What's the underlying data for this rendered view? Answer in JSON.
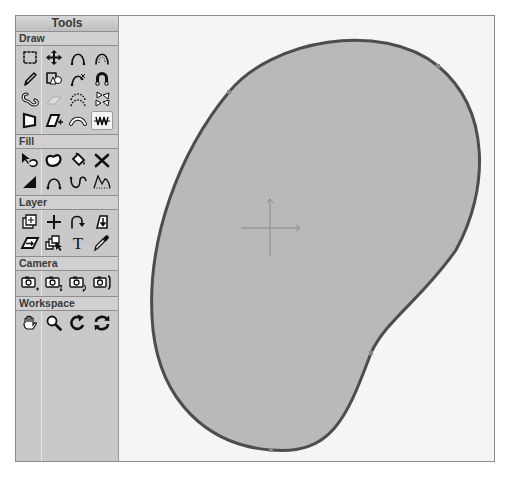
{
  "tools_panel": {
    "title": "Tools",
    "sections": [
      {
        "label": "Draw",
        "tools": [
          {
            "name": "marquee-select",
            "icon": "dashed-square-icon"
          },
          {
            "name": "move",
            "icon": "four-way-arrow-icon"
          },
          {
            "name": "arc",
            "icon": "arc-icon"
          },
          {
            "name": "dotted-arc",
            "icon": "dotted-arch-icon"
          },
          {
            "name": "pencil",
            "icon": "pencil-icon"
          },
          {
            "name": "shapes",
            "icon": "shapes-icon"
          },
          {
            "name": "curve-edit",
            "icon": "curve-points-icon"
          },
          {
            "name": "magnet",
            "icon": "magnet-icon"
          },
          {
            "name": "freeform-blob",
            "icon": "squiggle-icon"
          },
          {
            "name": "eraser",
            "icon": "eraser-icon"
          },
          {
            "name": "point-arc",
            "icon": "point-arc-icon"
          },
          {
            "name": "triangles",
            "icon": "triangles-icon"
          },
          {
            "name": "polygon",
            "icon": "polygon-icon"
          },
          {
            "name": "parallelogram-add",
            "icon": "parallelogram-icon"
          },
          {
            "name": "bend",
            "icon": "bend-icon"
          },
          {
            "name": "wave",
            "icon": "wave-icon",
            "selected": true
          }
        ]
      },
      {
        "label": "Fill",
        "tools": [
          {
            "name": "fill-select",
            "icon": "arrow-blob-icon"
          },
          {
            "name": "blob-fill",
            "icon": "blob-icon"
          },
          {
            "name": "paint-bucket",
            "icon": "bucket-icon"
          },
          {
            "name": "delete-fill",
            "icon": "x-icon"
          },
          {
            "name": "gradient",
            "icon": "ramp-icon"
          },
          {
            "name": "arch-fill",
            "icon": "arch-points-icon"
          },
          {
            "name": "u-curve",
            "icon": "u-curve-icon"
          },
          {
            "name": "mountain",
            "icon": "mountain-icon"
          }
        ]
      },
      {
        "label": "Layer",
        "tools": [
          {
            "name": "layer-transform",
            "icon": "layer-move-icon"
          },
          {
            "name": "add-point",
            "icon": "plus-icon"
          },
          {
            "name": "rotate-layer",
            "icon": "curve-arrow-icon"
          },
          {
            "name": "layer-order",
            "icon": "layer-down-icon"
          },
          {
            "name": "skew-layer",
            "icon": "skew-icon"
          },
          {
            "name": "select-layers",
            "icon": "layers-arrow-icon"
          },
          {
            "name": "text",
            "icon": "text-t-icon"
          },
          {
            "name": "eyedropper",
            "icon": "eyedropper-icon"
          }
        ]
      },
      {
        "label": "Camera",
        "tools": [
          {
            "name": "camera-track",
            "icon": "camera-plus-icon"
          },
          {
            "name": "camera-zoom",
            "icon": "camera-updown-icon"
          },
          {
            "name": "camera-roll",
            "icon": "camera-rotate-icon"
          },
          {
            "name": "camera-pan",
            "icon": "camera-bracket-icon"
          }
        ]
      },
      {
        "label": "Workspace",
        "tools": [
          {
            "name": "hand",
            "icon": "hand-icon"
          },
          {
            "name": "zoom",
            "icon": "magnifier-icon"
          },
          {
            "name": "rotate-workspace",
            "icon": "rotate-icon"
          },
          {
            "name": "reset-rotation",
            "icon": "refresh-icon"
          }
        ]
      }
    ]
  },
  "canvas": {
    "shape": {
      "name": "blob-shape",
      "fill": "#b9b9b9",
      "stroke": "#4d4d4d",
      "control_points": 4
    },
    "origin_marker": "crosshair"
  },
  "colors": {
    "panel_bg": "#c9c9c9",
    "canvas_bg": "#f5f5f5",
    "selected_tool_bg": "#f4f4f4"
  }
}
